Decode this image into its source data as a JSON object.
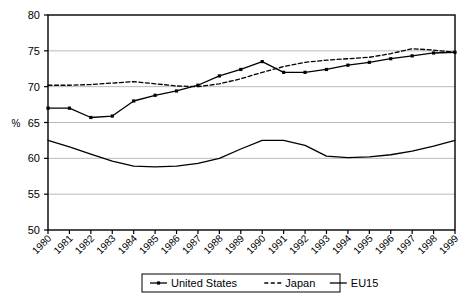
{
  "chart_data": {
    "type": "line",
    "title": "",
    "xlabel": "",
    "ylabel": "%",
    "ylim": [
      50,
      80
    ],
    "yticks": [
      50,
      55,
      60,
      65,
      70,
      75,
      80
    ],
    "grid": true,
    "legend_position": "bottom",
    "x": [
      1980,
      1981,
      1982,
      1983,
      1984,
      1985,
      1986,
      1987,
      1988,
      1989,
      1990,
      1991,
      1992,
      1993,
      1994,
      1995,
      1996,
      1997,
      1998,
      1999
    ],
    "categories": [
      "1980",
      "1981",
      "1982",
      "1983",
      "1984",
      "1985",
      "1986",
      "1987",
      "1988",
      "1989",
      "1990",
      "1991",
      "1992",
      "1993",
      "1994",
      "1995",
      "1996",
      "1997",
      "1998",
      "1999"
    ],
    "series": [
      {
        "name": "United States",
        "style": "solid-markers",
        "color": "#000000",
        "values": [
          67.0,
          67.0,
          65.7,
          65.9,
          68.0,
          68.8,
          69.4,
          70.2,
          71.5,
          72.4,
          73.5,
          72.0,
          72.0,
          72.4,
          73.0,
          73.4,
          73.9,
          74.3,
          74.7,
          74.8
        ]
      },
      {
        "name": "Japan",
        "style": "dashed",
        "color": "#000000",
        "values": [
          70.2,
          70.2,
          70.3,
          70.5,
          70.7,
          70.4,
          70.1,
          70.0,
          70.4,
          71.1,
          72.0,
          72.8,
          73.4,
          73.7,
          73.9,
          74.1,
          74.6,
          75.3,
          75.1,
          74.8
        ]
      },
      {
        "name": "EU15",
        "style": "solid",
        "color": "#000000",
        "values": [
          62.5,
          61.6,
          60.6,
          59.6,
          58.9,
          58.8,
          58.9,
          59.3,
          60.0,
          61.3,
          62.5,
          62.5,
          61.8,
          60.3,
          60.1,
          60.2,
          60.5,
          61.0,
          61.7,
          62.5
        ]
      }
    ]
  },
  "legend": {
    "items": [
      {
        "label": "United States",
        "style": "solid-markers"
      },
      {
        "label": "Japan",
        "style": "dashed"
      },
      {
        "label": "EU15",
        "style": "solid"
      }
    ]
  }
}
